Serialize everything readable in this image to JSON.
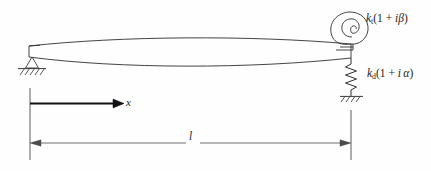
{
  "figure": {
    "background_color": "#fefefe",
    "line_color": "#2b2b2b",
    "accent_color": "#111111"
  },
  "labels": {
    "torsional_spring": {
      "stiffness_symbol": "k",
      "stiffness_subscript": "t",
      "expression_open": "(1 + ",
      "imaginary_unit": "i",
      "loss_factor": "β",
      "expression_close": ")",
      "full_text": "k_t(1 + iβ)"
    },
    "axial_spring": {
      "stiffness_symbol": "k",
      "stiffness_subscript": "d",
      "expression_open": "(1 + ",
      "imaginary_unit": "i",
      "loss_factor": "α",
      "expression_close": ")",
      "full_text": "k_d(1 + iα)"
    },
    "axis": {
      "name": "x"
    },
    "dimension": {
      "name": "l"
    }
  },
  "elements": {
    "beam": "deflected-beam",
    "left_support": "pinned-support",
    "torsional_spring_icon": "spiral-spring",
    "axial_spring_icon": "coil-spring",
    "ground_icon": "hatched-ground",
    "axis_arrow": "x-axis-arrow",
    "dimension_arrow": "length-dimension-arrow"
  }
}
